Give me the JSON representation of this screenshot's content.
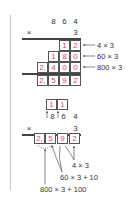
{
  "diagram": {
    "accent_color": "#d04a7a",
    "method1": {
      "multiplicand": [
        "8",
        "6",
        "4"
      ],
      "times_sign": "×",
      "multiplier": "3",
      "rows": [
        {
          "cells": [
            "1",
            "2"
          ],
          "label": "4 × 3"
        },
        {
          "cells": [
            "1",
            "8",
            "0"
          ],
          "label": "60 × 3"
        },
        {
          "cells": [
            "2,",
            "4",
            "0",
            "0"
          ],
          "label": "800 × 3"
        }
      ],
      "result": [
        "2,",
        "5",
        "9",
        "2"
      ]
    },
    "method2": {
      "carries": [
        "1",
        "1"
      ],
      "multiplicand": [
        "8",
        "6",
        "4"
      ],
      "times_sign": "×",
      "multiplier": "3",
      "result": [
        "2,",
        "5",
        "9",
        "2"
      ],
      "labels": [
        "4 × 3",
        "60 × 3 + 10",
        "800 × 3 + 100"
      ]
    }
  }
}
